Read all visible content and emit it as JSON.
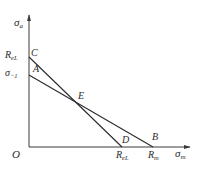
{
  "diagram": {
    "type": "haigh-diagram",
    "axes": {
      "y_label": {
        "main": "σ",
        "sub": "a"
      },
      "x_label": {
        "main": "σ",
        "sub": "m"
      },
      "origin_label": "O"
    },
    "y_ticks": [
      {
        "main": "R",
        "sub": "eL",
        "point": "C"
      },
      {
        "main": "σ",
        "sub": "−1",
        "point": "A"
      }
    ],
    "x_ticks": [
      {
        "main": "R",
        "sub": "eL",
        "point": "D"
      },
      {
        "main": "R",
        "sub": "m",
        "point": "B"
      }
    ],
    "points": {
      "A": "A",
      "B": "B",
      "C": "C",
      "D": "D",
      "E": "E"
    },
    "lines": [
      {
        "name": "line-AB",
        "from": "A",
        "to": "B"
      },
      {
        "name": "line-CD",
        "from": "C",
        "to": "D"
      }
    ],
    "intersection": "E"
  }
}
